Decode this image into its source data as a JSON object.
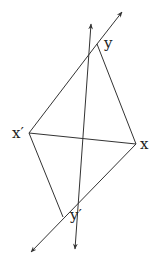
{
  "diagram": {
    "type": "geometric-quadrilateral",
    "points": {
      "y": {
        "label": "y",
        "x": 97,
        "y": 44
      },
      "x_prime": {
        "label": "x′",
        "x": 29,
        "y": 133
      },
      "x": {
        "label": "x",
        "x": 136,
        "y": 144
      },
      "y_prime": {
        "label": "y′",
        "x": 63,
        "y": 217
      }
    },
    "edges": [
      [
        "x_prime",
        "y"
      ],
      [
        "y",
        "x"
      ],
      [
        "x",
        "y_prime"
      ],
      [
        "y_prime",
        "x_prime"
      ],
      [
        "x_prime",
        "x"
      ]
    ],
    "rays": [
      {
        "name": "line-x-y-prime-extended",
        "from": [
          31,
          252
        ],
        "to": [
          122,
          12
        ]
      },
      {
        "name": "line-y-prime-y-extended",
        "from": [
          75,
          249
        ],
        "to": [
          91,
          24
        ]
      }
    ],
    "colors": {
      "stroke": "#333333",
      "label": "#222222",
      "background": "#ffffff"
    }
  }
}
